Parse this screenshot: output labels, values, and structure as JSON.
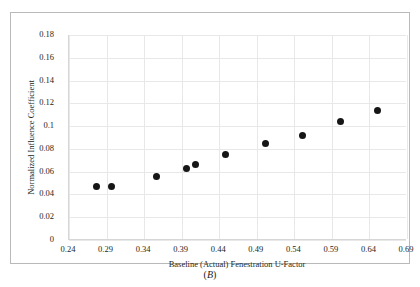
{
  "figure": {
    "caption": "(B)",
    "caption_prefix": "(",
    "caption_letter": "B",
    "caption_suffix": ")"
  },
  "chart_data": {
    "type": "scatter",
    "title": "",
    "xlabel": "Baseline (Actual) Fenestration U-Factor",
    "ylabel": "Normalized Influence Coefficient",
    "xlim": [
      0.24,
      0.69
    ],
    "ylim": [
      0,
      0.18
    ],
    "xticks": [
      0.24,
      0.29,
      0.34,
      0.39,
      0.44,
      0.49,
      0.54,
      0.59,
      0.64,
      0.69
    ],
    "xtick_labels": [
      "0.24",
      "0.29",
      "0.34",
      "0.39",
      "0.44",
      "0.49",
      "0.54",
      "0.59",
      "0.64",
      "0.69"
    ],
    "yticks": [
      0,
      0.02,
      0.04,
      0.06,
      0.08,
      0.1,
      0.12,
      0.14,
      0.16,
      0.18
    ],
    "ytick_labels": [
      "0",
      "0.02",
      "0.04",
      "0.06",
      "0.08",
      "0.1",
      "0.12",
      "0.14",
      "0.16",
      "0.18"
    ],
    "grid": true,
    "grid_axis": "both",
    "legend": false,
    "marker": "circle",
    "marker_color": "#161616",
    "marker_size": 7,
    "series": [
      {
        "name": "Normalized Influence Coefficient",
        "x": [
          0.276,
          0.296,
          0.357,
          0.397,
          0.409,
          0.449,
          0.501,
          0.551,
          0.601,
          0.651
        ],
        "y": [
          0.047,
          0.047,
          0.056,
          0.063,
          0.066,
          0.075,
          0.085,
          0.092,
          0.104,
          0.114
        ]
      }
    ]
  }
}
